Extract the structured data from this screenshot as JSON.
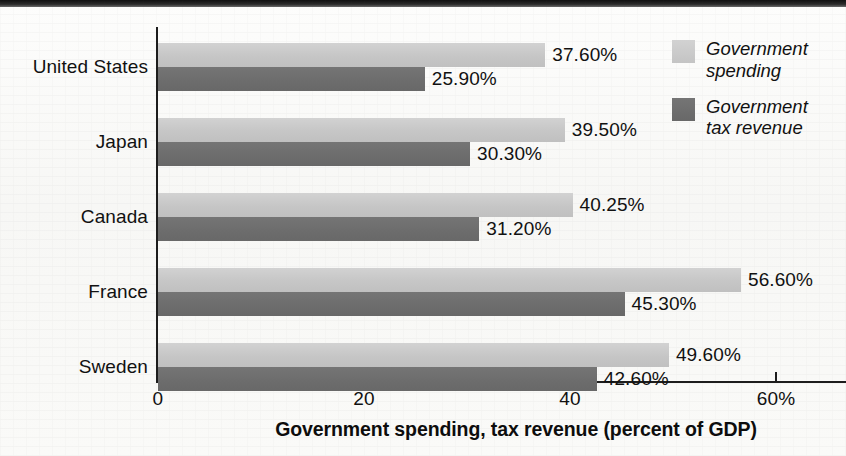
{
  "chart_data": {
    "type": "bar",
    "orientation": "horizontal",
    "title": "",
    "xlabel": "Government spending, tax revenue (percent of GDP)",
    "ylabel": "",
    "xlim": [
      0,
      67
    ],
    "xticks": [
      {
        "value": 0,
        "label": "0"
      },
      {
        "value": 20,
        "label": "20"
      },
      {
        "value": 40,
        "label": "40"
      },
      {
        "value": 60,
        "label": "60%"
      }
    ],
    "grid": false,
    "legend_position": "top-right",
    "categories": [
      "United States",
      "Japan",
      "Canada",
      "France",
      "Sweden"
    ],
    "series": [
      {
        "name": "Government spending",
        "color": "#c6c6c6",
        "values": [
          37.6,
          39.5,
          40.25,
          56.6,
          49.6
        ],
        "labels": [
          "37.60%",
          "39.50%",
          "40.25%",
          "56.60%",
          "49.60%"
        ]
      },
      {
        "name": "Government tax revenue",
        "color": "#6d6d6d",
        "values": [
          25.9,
          30.3,
          31.2,
          45.3,
          42.6
        ],
        "labels": [
          "25.90%",
          "30.30%",
          "31.20%",
          "45.30%",
          "42.60%"
        ]
      }
    ]
  },
  "legend": {
    "items": [
      {
        "label_line1": "Government",
        "label_line2": "spending",
        "swatch": "spending"
      },
      {
        "label_line1": "Government",
        "label_line2": "tax revenue",
        "swatch": "revenue"
      }
    ]
  },
  "axis": {
    "x_title": "Government spending, tax revenue (percent of GDP)"
  },
  "colors": {
    "spending": "#c6c6c6",
    "revenue": "#6d6d6d",
    "axis": "#1d1d1d",
    "text": "#111111",
    "page": "#fbfbfa"
  }
}
